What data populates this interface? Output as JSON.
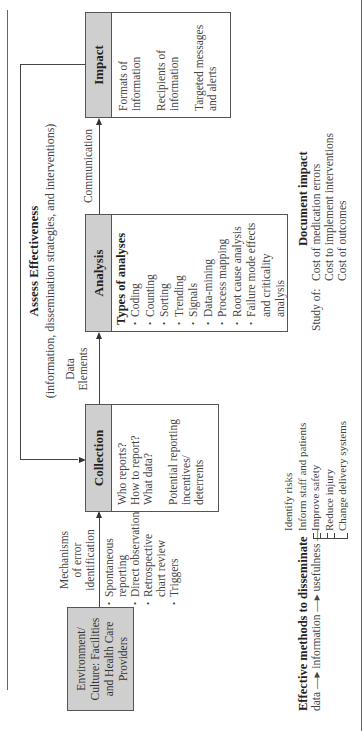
{
  "title": {
    "heading": "Assess Effectiveness",
    "subheading": "(information, dissemination strategies, and interventions)"
  },
  "environment_box": {
    "label": "Environment/ Culture: Facilities and Health Care Providers"
  },
  "mechanisms": {
    "heading_lines": [
      "Mechanisms",
      "of error",
      "identification"
    ],
    "items": [
      "Spontaneous reporting",
      "Direct observation",
      "Retrospective chart review",
      "Triggers"
    ]
  },
  "collection": {
    "header": "Collection",
    "questions": [
      "Who reports?",
      "How to report?",
      "What data?"
    ],
    "note": "Potential reporting incentives/ deterrents"
  },
  "data_elements": {
    "line1": "Data",
    "line2": "Elements"
  },
  "analysis": {
    "header": "Analysis",
    "subheader": "Types of analyses",
    "items": [
      "Coding",
      "Counting",
      "Sorting",
      "Trending",
      "Signals",
      "Data-mining",
      "Process mapping",
      "Root cause analysis",
      "Failure mode effects and criticality analysis"
    ]
  },
  "communication": {
    "label": "Communication"
  },
  "impact": {
    "header": "Impact",
    "items": [
      "Formats of information",
      "Recipients of information",
      "Targeted messages and alerts"
    ]
  },
  "disseminate": {
    "heading": "Effective methods to disseminate",
    "flow": [
      "data",
      "information",
      "usefulness"
    ],
    "outcomes": [
      "Identify risks",
      "Inform staff and patients",
      "Improve safety",
      "Reduce injury",
      "Change delivery systems"
    ]
  },
  "document_impact": {
    "heading": "Document impact",
    "prefix": "Study of:",
    "items": [
      "Cost of medication errors",
      "Cost to implement interventions",
      "Cost of outcomes"
    ]
  },
  "colors": {
    "header_fill": "#cfcfcf",
    "border": "#555555",
    "text": "#333333"
  }
}
